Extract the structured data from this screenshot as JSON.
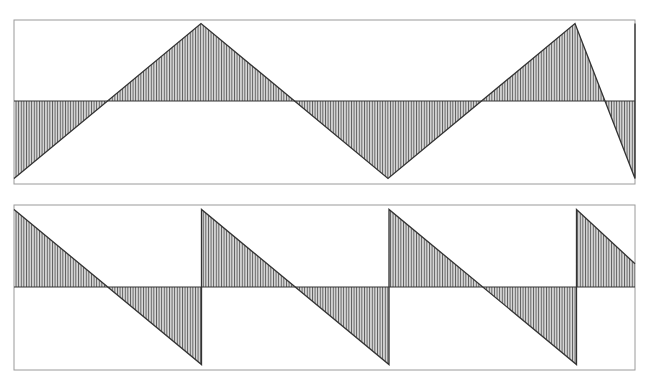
{
  "chart_data": [
    {
      "type": "area",
      "title": "",
      "waveform": "triangle",
      "xlabel": "",
      "ylabel": "",
      "grid": false,
      "legend": null,
      "description": "Triangle wave, area between curve and zero line filled with vertical hatching",
      "period_px": 187,
      "x": [
        0,
        0.5,
        1.0,
        1.5,
        2.0,
        2.5,
        3.0,
        3.33
      ],
      "values": [
        -1,
        1,
        -1,
        1,
        -1,
        1,
        -1,
        0.3
      ],
      "ylim": [
        -1.05,
        1.05
      ]
    },
    {
      "type": "area",
      "title": "",
      "waveform": "sawtooth (descending)",
      "xlabel": "",
      "ylabel": "",
      "grid": false,
      "legend": null,
      "description": "Descending sawtooth wave, area between curve and zero line filled with vertical hatching",
      "x": [
        0,
        1.0,
        1.0,
        2.0,
        2.0,
        3.0,
        3.0,
        3.33
      ],
      "values": [
        1,
        -1,
        1,
        -1,
        1,
        -1,
        1,
        0.3
      ],
      "ylim": [
        -1.05,
        1.05
      ]
    }
  ],
  "colors": {
    "frame": "#9a9a9a",
    "line": "#333333",
    "hatch": "#555555",
    "background": "#ffffff"
  }
}
